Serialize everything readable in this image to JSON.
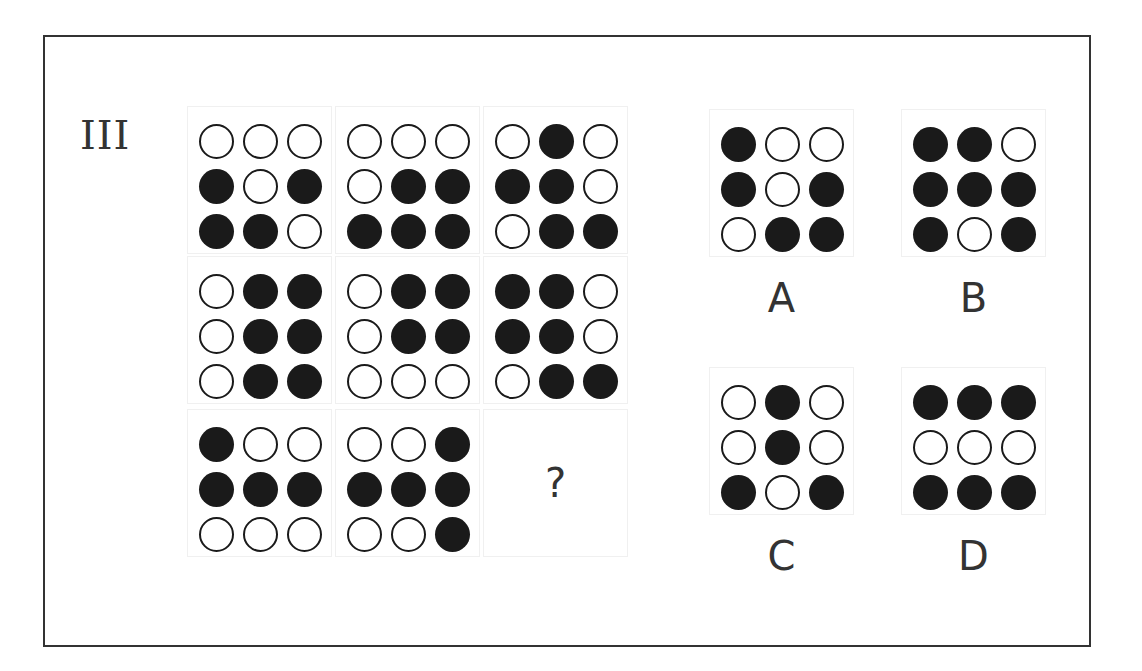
{
  "title": "III",
  "question_mark": "?",
  "matrix": [
    {
      "dots": [
        0,
        0,
        0,
        1,
        0,
        1,
        1,
        1,
        0
      ]
    },
    {
      "dots": [
        0,
        0,
        0,
        0,
        1,
        1,
        1,
        1,
        1
      ]
    },
    {
      "dots": [
        0,
        1,
        0,
        1,
        1,
        0,
        0,
        1,
        1
      ]
    },
    {
      "dots": [
        0,
        1,
        1,
        0,
        1,
        1,
        0,
        1,
        1
      ]
    },
    {
      "dots": [
        0,
        1,
        1,
        0,
        1,
        1,
        0,
        0,
        0
      ]
    },
    {
      "dots": [
        1,
        1,
        0,
        1,
        1,
        0,
        0,
        1,
        1
      ]
    },
    {
      "dots": [
        1,
        0,
        0,
        1,
        1,
        1,
        0,
        0,
        0
      ]
    },
    {
      "dots": [
        0,
        0,
        1,
        1,
        1,
        1,
        0,
        0,
        1
      ]
    },
    {
      "missing": true
    }
  ],
  "options": [
    {
      "label": "A",
      "dots": [
        1,
        0,
        0,
        1,
        0,
        1,
        0,
        1,
        1
      ]
    },
    {
      "label": "B",
      "dots": [
        1,
        1,
        0,
        1,
        1,
        1,
        1,
        0,
        1
      ]
    },
    {
      "label": "C",
      "dots": [
        0,
        1,
        0,
        0,
        1,
        0,
        1,
        0,
        1
      ]
    },
    {
      "label": "D",
      "dots": [
        1,
        1,
        1,
        0,
        0,
        0,
        1,
        1,
        1
      ]
    }
  ],
  "colors": {
    "filled": "#1a1a1a",
    "border": "#333333",
    "background": "#ffffff"
  }
}
